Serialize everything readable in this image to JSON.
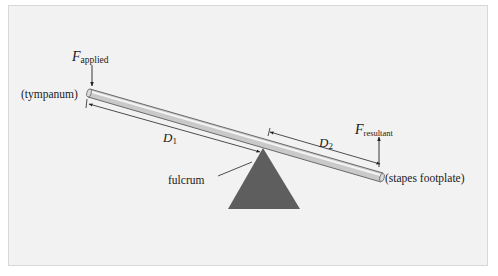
{
  "diagram": {
    "labels": {
      "force_applied_symbol": "F",
      "force_applied_subscript": "applied",
      "force_resultant_symbol": "F",
      "force_resultant_subscript": "resultant",
      "left_end": "(tympanum)",
      "right_end": "(stapes footplate)",
      "d1_symbol": "D",
      "d1_subscript": "1",
      "d2_symbol": "D",
      "d2_subscript": "2",
      "fulcrum": "fulcrum"
    },
    "colors": {
      "panel_bg": "#f2f2f2",
      "lever_fill": "#c9c9c9",
      "lever_highlight": "#eeeeee",
      "lever_edge": "#6a6a6a",
      "fulcrum_fill": "#5e5e5e",
      "line": "#222222"
    }
  }
}
